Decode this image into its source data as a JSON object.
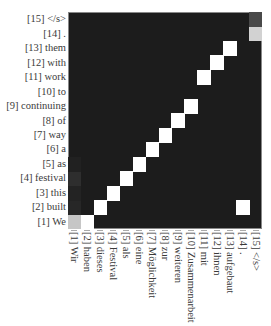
{
  "chart_data": {
    "type": "heatmap",
    "title": "",
    "xlabel": "",
    "ylabel": "",
    "grid": false,
    "legend": "none",
    "colormap": "grayscale (black = 0, white = 1)",
    "y_labels_bottom_to_top": [
      "[1] We",
      "[2] built",
      "[3] this",
      "[4] festival",
      "[5] as",
      "[6] a",
      "[7] way",
      "[8] of",
      "[9] continuing",
      "[10] to",
      "[11] work",
      "[12] with",
      "[13] them",
      "[14] .",
      "[15] </s>"
    ],
    "x_labels": [
      "[1] Wir",
      "[2] haben",
      "[3] dieses",
      "[4] Festival",
      "[5] als",
      "[6] eine",
      "[7] Möglichkeit",
      "[8] zur",
      "[9] weiteren",
      "[10] Zusammenarbeit",
      "[11] mit",
      "[12] ihnen",
      "[13] aufgebaut",
      "[14] .",
      "[15] </s>"
    ],
    "values_rows_bottom_to_top": [
      [
        0.75,
        1.0,
        0,
        0,
        0,
        0,
        0,
        0,
        0,
        0,
        0,
        0,
        0,
        0,
        0
      ],
      [
        0.05,
        0,
        1.0,
        0,
        0,
        0,
        0,
        0,
        0,
        0,
        0,
        0,
        0,
        1.0,
        0
      ],
      [
        0.03,
        0,
        0,
        1.0,
        0,
        0,
        0,
        0,
        0,
        0,
        0,
        0,
        0,
        0,
        0
      ],
      [
        0.08,
        0,
        0,
        0,
        1.0,
        0,
        0,
        0,
        0,
        0,
        0,
        0,
        0,
        0,
        0
      ],
      [
        0.02,
        0,
        0,
        0,
        0,
        1.0,
        0,
        0,
        0,
        0,
        0,
        0,
        0,
        0,
        0
      ],
      [
        0,
        0,
        0,
        0,
        0,
        0,
        1.0,
        0,
        0,
        0,
        0,
        0,
        0,
        0,
        0
      ],
      [
        0,
        0,
        0,
        0,
        0,
        0,
        0,
        1.0,
        0,
        0,
        0,
        0,
        0,
        0,
        0
      ],
      [
        0,
        0,
        0,
        0,
        0,
        0,
        0,
        0,
        1.0,
        0,
        0,
        0,
        0,
        0,
        0
      ],
      [
        0,
        0,
        0,
        0,
        0,
        0,
        0,
        0,
        0,
        1.0,
        0,
        0,
        0,
        0,
        0
      ],
      [
        0,
        0,
        0,
        0,
        0,
        0,
        0,
        0,
        0,
        0,
        0,
        0,
        0,
        0,
        0
      ],
      [
        0,
        0,
        0,
        0,
        0,
        0,
        0,
        0,
        0,
        0,
        1.0,
        0,
        0,
        0,
        0
      ],
      [
        0,
        0,
        0,
        0,
        0,
        0,
        0,
        0,
        0,
        0,
        0,
        1.0,
        0,
        0,
        0
      ],
      [
        0,
        0,
        0,
        0,
        0,
        0,
        0,
        0,
        0,
        0,
        0,
        0,
        1.0,
        0,
        0
      ],
      [
        0,
        0,
        0,
        0,
        0,
        0,
        0,
        0,
        0,
        0,
        0,
        0,
        0,
        0,
        0.8
      ],
      [
        0,
        0,
        0,
        0,
        0,
        0,
        0,
        0,
        0,
        0,
        0,
        0,
        0,
        0,
        0.2
      ]
    ]
  }
}
